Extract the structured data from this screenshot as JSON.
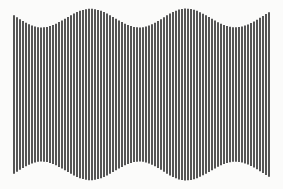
{
  "figure": {
    "width": 283,
    "height": 189,
    "background_color": "#fbfbfa",
    "bar_color": "#2b2b2b"
  },
  "chart_data": {
    "type": "bar",
    "title": "",
    "subtitle": "",
    "xlabel": "",
    "ylabel": "",
    "grid": false,
    "legend": null,
    "orientation": "vertical",
    "bars_centered": true,
    "center_y": 94.5,
    "x_start": 14.0,
    "x_end": 269.0,
    "bar_count": 86,
    "bar_pitch": 3.0,
    "bar_width": 1.6,
    "envelope": {
      "function": "height = mid + amp * cos(2*pi*(x - peak_x0)/period)",
      "mid_height": 153.5,
      "amplitude": 19.5,
      "min_height": 134.0,
      "max_height": 173.0,
      "period": 94.0,
      "peak_x0": 80.0,
      "peak_positions": [
        80,
        174,
        268
      ],
      "trough_positions": [
        33,
        127,
        221
      ]
    },
    "x": [
      14.0,
      17.0,
      20.0,
      23.0,
      26.0,
      29.0,
      32.0,
      35.0,
      38.0,
      41.0,
      44.0,
      47.0,
      50.0,
      53.0,
      56.0,
      59.0,
      62.0,
      65.0,
      68.0,
      71.0,
      74.0,
      77.0,
      80.0,
      83.0,
      86.0,
      89.0,
      92.0,
      95.0,
      98.0,
      101.0,
      104.0,
      107.0,
      110.0,
      113.0,
      116.0,
      119.0,
      122.0,
      125.0,
      128.0,
      131.0,
      134.0,
      137.0,
      140.0,
      143.0,
      146.0,
      149.0,
      152.0,
      155.0,
      158.0,
      161.0,
      164.0,
      167.0,
      170.0,
      173.0,
      176.0,
      179.0,
      182.0,
      185.0,
      188.0,
      191.0,
      194.0,
      197.0,
      200.0,
      203.0,
      206.0,
      209.0,
      212.0,
      215.0,
      218.0,
      221.0,
      224.0,
      227.0,
      230.0,
      233.0,
      236.0,
      239.0,
      242.0,
      245.0,
      248.0,
      251.0,
      254.0,
      257.0,
      260.0,
      263.0,
      266.0,
      269.0
    ],
    "values": [
      158.3,
      154.6,
      150.6,
      146.8,
      143.3,
      140.3,
      137.8,
      135.9,
      134.6,
      134.1,
      134.3,
      135.2,
      136.8,
      139.0,
      141.7,
      144.8,
      148.2,
      151.7,
      155.2,
      158.7,
      161.9,
      164.8,
      167.3,
      169.2,
      170.6,
      171.3,
      171.3,
      170.6,
      169.2,
      167.3,
      164.8,
      161.9,
      158.7,
      155.2,
      151.7,
      148.2,
      144.8,
      141.7,
      139.0,
      136.8,
      135.2,
      134.3,
      134.1,
      134.6,
      135.9,
      137.8,
      140.3,
      143.3,
      146.8,
      150.6,
      154.6,
      158.3,
      161.9,
      165.0,
      167.7,
      169.8,
      171.1,
      171.8,
      171.7,
      170.9,
      169.4,
      167.3,
      164.7,
      161.7,
      158.4,
      154.9,
      151.3,
      147.8,
      144.5,
      141.6,
      139.1,
      137.1,
      135.6,
      134.7,
      134.5,
      135.0,
      136.1,
      137.9,
      140.2,
      143.0,
      146.2,
      149.7,
      153.4,
      157.1,
      160.8,
      164.3
    ],
    "ylim": [
      0,
      189
    ],
    "xlim": [
      0,
      283
    ]
  }
}
